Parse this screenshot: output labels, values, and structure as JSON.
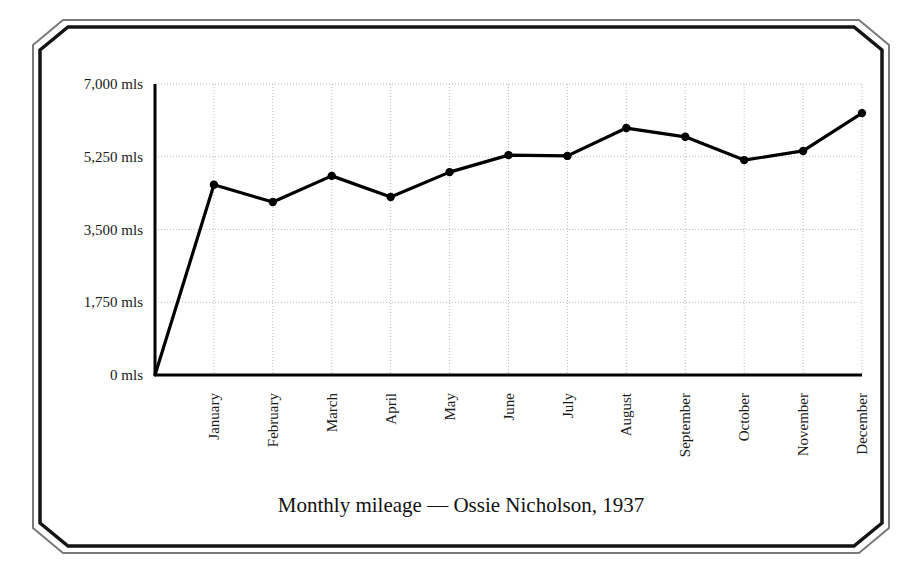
{
  "frame": {
    "style": "double-line-chamfered-border",
    "outer_color": "#6b6b6b",
    "inner_color": "#111111"
  },
  "chart_data": {
    "type": "line",
    "title": "Monthly mileage — Ossie Nicholson, 1937",
    "xlabel": "",
    "ylabel": "",
    "categories": [
      "January",
      "February",
      "March",
      "April",
      "May",
      "June",
      "July",
      "August",
      "September",
      "October",
      "November",
      "December"
    ],
    "values": [
      4575,
      4160,
      4790,
      4280,
      4880,
      5290,
      5270,
      5940,
      5730,
      5170,
      5390,
      6300
    ],
    "series": [
      {
        "name": "Monthly mileage",
        "values": [
          4575,
          4160,
          4790,
          4280,
          4880,
          5290,
          5270,
          5940,
          5730,
          5170,
          5390,
          6300
        ]
      }
    ],
    "ylim": [
      0,
      7000
    ],
    "ytick_values": [
      0,
      1750,
      3500,
      5250,
      7000
    ],
    "ytick_labels": [
      "0 mls",
      "1,750 mls",
      "3,500 mls",
      "5,250 mls",
      "7,000 mls"
    ],
    "grid": true,
    "grid_style": "dotted",
    "grid_color": "#bbbbbb",
    "legend": "none",
    "line_color": "#000000",
    "marker": "circle",
    "marker_color": "#000000",
    "starts_at_origin": true,
    "units": "mls",
    "xtick_label_rotation": 90
  }
}
